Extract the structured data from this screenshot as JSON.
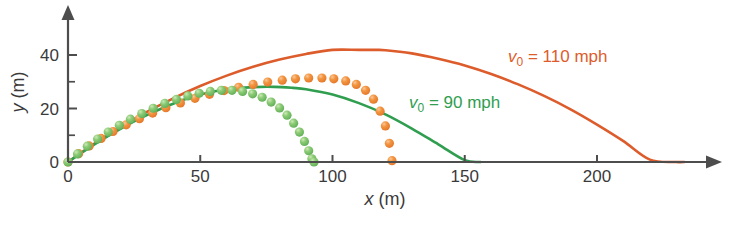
{
  "chart_data": {
    "type": "line",
    "title": "",
    "xlabel": "x (m)",
    "xlabel_symbol": "x",
    "xlabel_unit": "(m)",
    "ylabel": "y (m)",
    "ylabel_symbol": "y",
    "ylabel_unit": "(m)",
    "xlim": [
      0,
      245
    ],
    "ylim": [
      0,
      48
    ],
    "xticks": [
      0,
      50,
      100,
      150,
      200
    ],
    "xticklabels": [
      "0",
      "50",
      "100",
      "150",
      "200"
    ],
    "yticks": [
      0,
      20,
      40
    ],
    "yticklabels": [
      "0",
      "20",
      "40"
    ],
    "yminorticks": [
      10,
      30
    ],
    "grid": false,
    "legend_position": "inline-annotation",
    "series": [
      {
        "name": "v0 = 110 mph (no drag)",
        "style": "solid",
        "color": "#DD5C2B",
        "x": [
          0,
          10,
          20,
          30,
          40,
          50,
          60,
          70,
          80,
          90,
          100,
          110,
          116,
          120,
          130,
          140,
          150,
          160,
          170,
          180,
          190,
          200,
          210,
          220,
          230,
          233
        ],
        "y": [
          0,
          6.9,
          13.1,
          18.8,
          23.9,
          28.4,
          32.3,
          35.6,
          38.3,
          40.4,
          41.9,
          41.9,
          41.9,
          41.8,
          40.6,
          38.6,
          36.1,
          32.9,
          29.1,
          24.7,
          19.7,
          14.0,
          7.8,
          0.9,
          0.0,
          0.0
        ]
      },
      {
        "name": "v0 = 90 mph (no drag)",
        "style": "solid",
        "color": "#2F9E4F",
        "x": [
          0,
          10,
          20,
          30,
          40,
          50,
          60,
          70,
          78,
          85,
          90,
          100,
          110,
          120,
          130,
          140,
          150,
          156
        ],
        "y": [
          0,
          6.6,
          12.5,
          17.6,
          21.9,
          25.2,
          27.2,
          28.0,
          28.1,
          27.7,
          27.2,
          25.2,
          22.0,
          17.8,
          12.5,
          6.6,
          0.7,
          0.0
        ]
      },
      {
        "name": "v0 = 110 mph (with drag)",
        "style": "dotted",
        "color": "#ED7F3A",
        "marker": "sphere",
        "x": [
          0,
          4,
          8,
          12.5,
          17,
          22,
          27,
          32,
          37,
          42.5,
          48,
          53.5,
          59,
          64.5,
          70,
          75.5,
          81,
          86,
          91,
          96,
          100.5,
          105,
          109,
          112.5,
          115.5,
          118,
          120,
          121.5,
          122.5
        ],
        "y": [
          0,
          3.1,
          6.0,
          8.8,
          11.4,
          13.9,
          16.2,
          18.3,
          20.3,
          22.1,
          23.8,
          25.3,
          26.7,
          27.9,
          29.0,
          29.9,
          30.6,
          31.1,
          31.4,
          31.4,
          31.1,
          30.3,
          29.0,
          26.8,
          23.5,
          19.0,
          13.5,
          7.0,
          0.5
        ]
      },
      {
        "name": "v0 = 90 mph (with drag)",
        "style": "dotted",
        "color": "#78C46C",
        "marker": "sphere",
        "x": [
          0,
          3.6,
          7.3,
          11.2,
          15.2,
          19.4,
          23.6,
          27.9,
          32.2,
          36.6,
          41.0,
          45.3,
          49.6,
          53.8,
          58.0,
          62.0,
          66.0,
          69.8,
          73.4,
          76.8,
          80.0,
          82.8,
          85.3,
          87.5,
          89.4,
          91.0,
          92.2,
          93.0
        ],
        "y": [
          0,
          3.0,
          5.9,
          8.6,
          11.2,
          13.7,
          16.0,
          18.1,
          20.1,
          21.9,
          23.4,
          24.7,
          25.7,
          26.4,
          26.8,
          26.8,
          26.4,
          25.5,
          24.2,
          22.4,
          20.2,
          17.5,
          14.5,
          11.2,
          7.7,
          4.2,
          1.2,
          0.0
        ]
      }
    ],
    "annotations": [
      {
        "id": "label-110",
        "text": "v0 = 110 mph",
        "symbol": "v",
        "subscript": "0",
        "rest": " = 110 mph",
        "color": "#DD5C2B",
        "x_px": 508,
        "y_px": 62
      },
      {
        "id": "label-90",
        "text": "v0 = 90 mph",
        "symbol": "v",
        "subscript": "0",
        "rest": " = 90 mph",
        "color": "#2F9E4F",
        "x_px": 409,
        "y_px": 108
      }
    ]
  },
  "axes": {
    "colors": {
      "axis": "#4d4d4d",
      "text": "#3a3a3a",
      "orange_solid": "#DD5C2B",
      "green_solid": "#2F9E4F",
      "orange_dots": "#ED7F3A",
      "green_dots": "#78C46C"
    }
  }
}
